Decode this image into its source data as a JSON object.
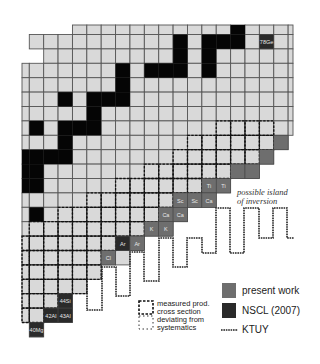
{
  "chart_data": {
    "type": "heatmap",
    "title": "",
    "grid": {
      "origin_x": 29.3,
      "origin_y": 34.5,
      "cell_w": 14.38,
      "cell_h": 14.4,
      "rows": [
        {
          "r": -1,
          "from": 3,
          "to": 18
        },
        {
          "r": 0,
          "from": 0,
          "to": 18
        },
        {
          "r": 1,
          "from": 1,
          "to": 18
        },
        {
          "r": 2,
          "from": -1,
          "to": 18
        },
        {
          "r": 3,
          "from": -1,
          "to": 18
        },
        {
          "r": 4,
          "from": -1,
          "to": 18
        },
        {
          "r": 5,
          "from": -1,
          "to": 18
        },
        {
          "r": 6,
          "from": -1,
          "to": 18
        },
        {
          "r": 7,
          "from": -1,
          "to": 17
        },
        {
          "r": 8,
          "from": -1,
          "to": 16
        },
        {
          "r": 9,
          "from": -1,
          "to": 15
        },
        {
          "r": 10,
          "from": -1,
          "to": 13
        },
        {
          "r": 11,
          "from": -1,
          "to": 12
        },
        {
          "r": 12,
          "from": -1,
          "to": 10
        },
        {
          "r": 13,
          "from": -1,
          "to": 9
        },
        {
          "r": 14,
          "from": -1,
          "to": 7
        },
        {
          "r": 15,
          "from": -1,
          "to": 6
        },
        {
          "r": 16,
          "from": -1,
          "to": 4
        },
        {
          "r": 17,
          "from": -1,
          "to": 3
        },
        {
          "r": 18,
          "from": -1,
          "to": 2
        },
        {
          "r": 19,
          "from": -1,
          "to": 2
        },
        {
          "r": 20,
          "from": 0,
          "to": 0
        }
      ],
      "black_cells": [
        [
          -1,
          14
        ],
        [
          0,
          10
        ],
        [
          0,
          12
        ],
        [
          0,
          13
        ],
        [
          0,
          14
        ],
        [
          1,
          10
        ],
        [
          1,
          12
        ],
        [
          2,
          6
        ],
        [
          2,
          8
        ],
        [
          2,
          9
        ],
        [
          2,
          10
        ],
        [
          2,
          12
        ],
        [
          3,
          6
        ],
        [
          4,
          2
        ],
        [
          4,
          4
        ],
        [
          4,
          5
        ],
        [
          4,
          6
        ],
        [
          5,
          4
        ],
        [
          6,
          0
        ],
        [
          6,
          2
        ],
        [
          6,
          3
        ],
        [
          6,
          4
        ],
        [
          7,
          2
        ],
        [
          8,
          -1
        ],
        [
          8,
          0
        ],
        [
          8,
          1
        ],
        [
          8,
          2
        ],
        [
          9,
          -1
        ],
        [
          9,
          0
        ],
        [
          10,
          -1
        ],
        [
          10,
          0
        ],
        [
          12,
          0
        ]
      ],
      "dashed_rows": [
        {
          "r": 6,
          "from": 13,
          "to": 16
        },
        {
          "r": 7,
          "from": 11,
          "to": 16
        },
        {
          "r": 8,
          "from": 10,
          "to": 15
        },
        {
          "r": 9,
          "from": 8,
          "to": 13
        },
        {
          "r": 10,
          "from": 6,
          "to": 11
        },
        {
          "r": 11,
          "from": 4,
          "to": 9
        },
        {
          "r": 12,
          "from": 2,
          "to": 8
        },
        {
          "r": 13,
          "from": 0,
          "to": 7
        },
        {
          "r": 14,
          "from": -1,
          "to": 5
        },
        {
          "r": 15,
          "from": -1,
          "to": 4
        },
        {
          "r": 16,
          "from": -1,
          "to": 4
        },
        {
          "r": 17,
          "from": -1,
          "to": 3
        },
        {
          "r": 18,
          "from": -1,
          "to": 1
        },
        {
          "r": 19,
          "from": -1,
          "to": 0
        }
      ]
    },
    "highlighted_isotopes": [
      {
        "r": 0,
        "c": 16,
        "label": "78Ge",
        "source": "NSCL (2007)"
      },
      {
        "r": 7,
        "c": 17,
        "label": "",
        "source": "present work"
      },
      {
        "r": 8,
        "c": 16,
        "label": "",
        "source": "present work"
      },
      {
        "r": 9,
        "c": 14,
        "label": "",
        "source": "present work"
      },
      {
        "r": 9,
        "c": 15,
        "label": "",
        "source": "present work"
      },
      {
        "r": 10,
        "c": 12,
        "label": "Ti",
        "source": "present work"
      },
      {
        "r": 10,
        "c": 13,
        "label": "Ti",
        "source": "present work"
      },
      {
        "r": 11,
        "c": 10,
        "label": "Sc",
        "source": "present work"
      },
      {
        "r": 11,
        "c": 11,
        "label": "Sc",
        "source": "present work"
      },
      {
        "r": 11,
        "c": 12,
        "label": "Ca",
        "source": "present work"
      },
      {
        "r": 12,
        "c": 9,
        "label": "Ca",
        "source": "present work"
      },
      {
        "r": 12,
        "c": 10,
        "label": "Ca",
        "source": "present work"
      },
      {
        "r": 13,
        "c": 8,
        "label": "K",
        "source": "present work"
      },
      {
        "r": 13,
        "c": 9,
        "label": "K",
        "source": "present work"
      },
      {
        "r": 14,
        "c": 6,
        "label": "Ar",
        "source": "NSCL (2007)"
      },
      {
        "r": 14,
        "c": 7,
        "label": "Ar",
        "source": "present work"
      },
      {
        "r": 15,
        "c": 5,
        "label": "Cl",
        "source": "present work"
      },
      {
        "r": 18,
        "c": 2,
        "label": "44Si",
        "source": "NSCL (2007)"
      },
      {
        "r": 19,
        "c": 1,
        "label": "42Al",
        "source": "NSCL (2007)"
      },
      {
        "r": 19,
        "c": 2,
        "label": "43Al",
        "source": "NSCL (2007)"
      },
      {
        "r": 20,
        "c": 0,
        "label": "40Mg",
        "source": "NSCL (2007)"
      }
    ],
    "ktuy_line": [
      [
        87,
        281
      ],
      [
        87,
        310
      ],
      [
        102,
        310
      ],
      [
        102,
        267
      ],
      [
        116,
        267
      ],
      [
        116,
        296
      ],
      [
        130,
        296
      ],
      [
        130,
        252
      ],
      [
        144,
        252
      ],
      [
        144,
        281
      ],
      [
        159,
        281
      ],
      [
        159,
        238
      ],
      [
        173,
        238
      ],
      [
        173,
        267
      ],
      [
        187,
        267
      ],
      [
        187,
        238
      ],
      [
        202,
        238
      ],
      [
        202,
        253
      ],
      [
        216,
        253
      ],
      [
        216,
        208
      ],
      [
        230,
        208
      ],
      [
        230,
        253
      ],
      [
        244,
        253
      ],
      [
        244,
        208
      ],
      [
        259,
        208
      ],
      [
        259,
        238
      ],
      [
        273,
        238
      ],
      [
        273,
        208
      ],
      [
        287,
        208
      ],
      [
        287,
        238
      ],
      [
        294,
        238
      ]
    ],
    "annotation": {
      "line1": "possible island",
      "line2": "of inversion"
    },
    "legend": [
      {
        "key": "present_work",
        "label": "present work",
        "style": "mid-gray stipple filled square"
      },
      {
        "key": "nscl_2007",
        "label": "NSCL (2007)",
        "style": "dark filled square"
      },
      {
        "key": "ktuy",
        "label": "KTUY",
        "style": "dotted line"
      },
      {
        "key": "measured",
        "label_line1": "measured prod.",
        "label_line2": "cross section",
        "style": "dashed box (heavy)"
      },
      {
        "key": "deviating",
        "label_line1": "deviating from",
        "label_line2": "systematics",
        "style": "dashed box (light)"
      }
    ]
  },
  "colors": {
    "cell_fill": "#d9d9d9",
    "cell_line": "#555555",
    "black": "#050505",
    "present_work": "#6e6e6e",
    "nscl": "#2a2a2a",
    "label_text": "#e8e8e8",
    "dashed": "#111111"
  }
}
